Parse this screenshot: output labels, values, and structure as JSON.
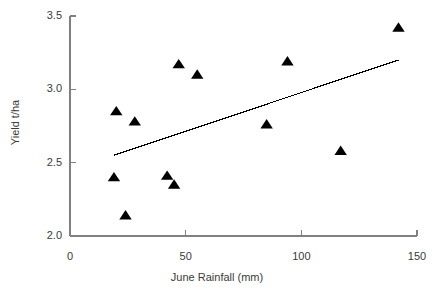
{
  "chart_data": {
    "type": "scatter",
    "title": "",
    "xlabel": "June Rainfall (mm)",
    "ylabel": "Yield t/ha",
    "xlim": [
      0,
      150
    ],
    "ylim": [
      2.0,
      3.5
    ],
    "xticks": [
      0,
      50,
      100,
      150
    ],
    "yticks": [
      2.0,
      2.5,
      3.0,
      3.5
    ],
    "xtick_labels": [
      "0",
      "50",
      "100",
      "150"
    ],
    "ytick_labels": [
      "2.0",
      "2.5",
      "3.0",
      "3.5"
    ],
    "grid": false,
    "legend": false,
    "marker": "triangle",
    "marker_color": "#000000",
    "axis_color": "#808080",
    "series": [
      {
        "name": "Yield vs June Rainfall",
        "points": [
          {
            "x": 19,
            "y": 2.4
          },
          {
            "x": 20,
            "y": 2.85
          },
          {
            "x": 24,
            "y": 2.14
          },
          {
            "x": 28,
            "y": 2.78
          },
          {
            "x": 42,
            "y": 2.41
          },
          {
            "x": 45,
            "y": 2.35
          },
          {
            "x": 47,
            "y": 3.17
          },
          {
            "x": 55,
            "y": 3.1
          },
          {
            "x": 85,
            "y": 2.76
          },
          {
            "x": 94,
            "y": 3.19
          },
          {
            "x": 117,
            "y": 2.58
          },
          {
            "x": 142,
            "y": 3.42
          }
        ]
      }
    ],
    "trendline": {
      "type": "linear",
      "color": "#000000",
      "x_start": 19,
      "y_start": 2.55,
      "x_end": 142,
      "y_end": 3.2
    }
  }
}
